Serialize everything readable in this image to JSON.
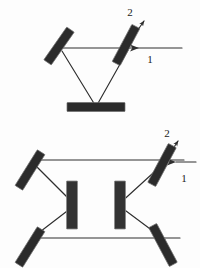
{
  "figure": {
    "background_color": "#fdfdfd",
    "optic_color": "#2b2b2b",
    "beam_color": "#2e2e2e",
    "label_color": "#1a1a1a",
    "width": 200,
    "height": 268
  },
  "diagrams": [
    {
      "id": "upper",
      "name": "three-mirror-triangular-cavity",
      "elements": [
        {
          "name": "left-fold-mirror",
          "kind": "mirror",
          "cx": 59,
          "cy": 46,
          "length": 40,
          "thickness": 9,
          "angle_deg": -55
        },
        {
          "name": "beamsplitter",
          "kind": "beamsplitter",
          "cx": 126,
          "cy": 45,
          "length": 42,
          "thickness": 9,
          "angle_deg": -62
        },
        {
          "name": "bottom-end-mirror",
          "kind": "mirror",
          "cx": 96,
          "cy": 107,
          "length": 58,
          "thickness": 9,
          "angle_deg": 0
        }
      ],
      "beams": [
        {
          "name": "horizontal-beam",
          "x1": 62,
          "y1": 48,
          "x2": 182,
          "y2": 48
        },
        {
          "name": "left-down-beam",
          "x1": 62,
          "y1": 50,
          "x2": 95,
          "y2": 105
        },
        {
          "name": "right-down-beam",
          "x1": 127,
          "y1": 48,
          "x2": 96,
          "y2": 105
        }
      ],
      "labels": [
        {
          "name": "output-port-label",
          "text": "2",
          "x": 130,
          "y": 16
        },
        {
          "name": "input-port-label",
          "text": "1",
          "x": 149,
          "y": 62
        }
      ],
      "arrows": [
        {
          "name": "output-arrow",
          "x1": 126,
          "y1": 45,
          "x2": 143,
          "y2": 22
        },
        {
          "name": "input-arrow",
          "x1": 182,
          "y1": 48,
          "x2": 131,
          "y2": 48
        }
      ]
    },
    {
      "id": "lower",
      "name": "four-mirror-ring-cavity",
      "elements": [
        {
          "name": "upper-left-mirror",
          "kind": "mirror",
          "cx": 30,
          "cy": 170,
          "length": 42,
          "thickness": 9,
          "angle_deg": -58
        },
        {
          "name": "lower-left-mirror",
          "kind": "mirror",
          "cx": 30,
          "cy": 247,
          "length": 42,
          "thickness": 9,
          "angle_deg": -58
        },
        {
          "name": "upper-right-beamsplitter",
          "kind": "beamsplitter",
          "cx": 162,
          "cy": 165,
          "length": 44,
          "thickness": 9,
          "angle_deg": -62
        },
        {
          "name": "lower-right-mirror",
          "kind": "mirror",
          "cx": 163,
          "cy": 245,
          "length": 44,
          "thickness": 9,
          "angle_deg": 62
        },
        {
          "name": "left-intracavity-element",
          "kind": "crystal",
          "cx": 72,
          "cy": 205,
          "length": 48,
          "thickness": 11,
          "angle_deg": 90
        },
        {
          "name": "right-intracavity-element",
          "kind": "crystal",
          "cx": 120,
          "cy": 205,
          "length": 48,
          "thickness": 11,
          "angle_deg": 90
        }
      ],
      "beams": [
        {
          "name": "top-horizontal-beam",
          "x1": 32,
          "y1": 160,
          "x2": 182,
          "y2": 160
        },
        {
          "name": "bottom-horizontal-beam",
          "x1": 32,
          "y1": 238,
          "x2": 180,
          "y2": 238
        },
        {
          "name": "upper-left-diagonal",
          "x1": 32,
          "y1": 162,
          "x2": 74,
          "y2": 205
        },
        {
          "name": "lower-left-diagonal",
          "x1": 32,
          "y1": 238,
          "x2": 74,
          "y2": 205
        },
        {
          "name": "upper-right-diagonal",
          "x1": 162,
          "y1": 163,
          "x2": 119,
          "y2": 205
        },
        {
          "name": "lower-right-diagonal",
          "x1": 163,
          "y1": 240,
          "x2": 119,
          "y2": 205
        }
      ],
      "labels": [
        {
          "name": "output-port-label",
          "text": "2",
          "x": 167,
          "y": 136
        },
        {
          "name": "input-port-label",
          "text": "1",
          "x": 182,
          "y": 180
        }
      ],
      "arrows": [
        {
          "name": "output-arrow",
          "x1": 162,
          "y1": 165,
          "x2": 176,
          "y2": 142
        },
        {
          "name": "input-arrow",
          "x1": 196,
          "y1": 162,
          "x2": 167,
          "y2": 162
        }
      ]
    }
  ]
}
